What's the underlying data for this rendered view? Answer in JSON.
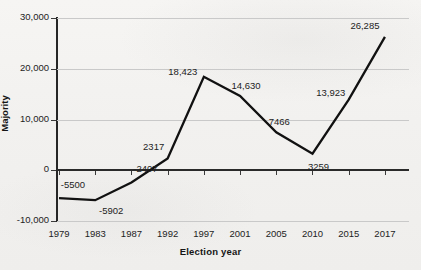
{
  "chart_data": {
    "type": "line",
    "title": "",
    "xlabel": "Election year",
    "ylabel": "Majority",
    "categories": [
      "1979",
      "1983",
      "1987",
      "1992",
      "1997",
      "2001",
      "2005",
      "2010",
      "2015",
      "2017"
    ],
    "values": [
      -5500,
      -5902,
      -2407,
      2317,
      18423,
      14630,
      7466,
      3259,
      13923,
      26285
    ],
    "point_labels": [
      "-5500",
      "-5902",
      "-2407",
      "2317",
      "18,423",
      "14,630",
      "7466",
      "3259",
      "13,923",
      "26,285"
    ],
    "series": [
      {
        "name": "Majority",
        "values": [
          -5500,
          -5902,
          -2407,
          2317,
          18423,
          14630,
          7466,
          3259,
          13923,
          26285
        ]
      }
    ],
    "ylim": [
      -10000,
      30000
    ],
    "ytick_values": [
      30000,
      20000,
      10000,
      0,
      -10000
    ],
    "ytick_labels": [
      "30,000",
      "20,000",
      "10,000",
      "0",
      "-10,000"
    ],
    "grid": true,
    "legend": "none",
    "line_color": "#111111",
    "grid_color": "#c9c9c9",
    "axis_color": "#262626",
    "background_color": "#f3f2f0"
  }
}
